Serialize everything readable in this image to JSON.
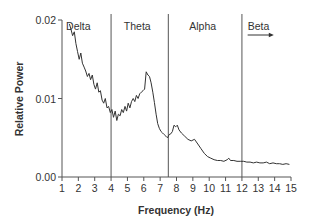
{
  "chart_data": {
    "type": "line",
    "title": "",
    "xlabel": "Frequency (Hz)",
    "ylabel": "Relative Power",
    "xlim": [
      1,
      15
    ],
    "ylim": [
      0,
      0.02
    ],
    "grid": false,
    "legend": "none",
    "x_ticks": [
      1,
      2,
      3,
      4,
      5,
      6,
      7,
      8,
      9,
      10,
      11,
      12,
      13,
      14,
      15
    ],
    "y_ticks": [
      "0.00",
      "0.01",
      "0.02"
    ],
    "y_tick_values": [
      0,
      0.01,
      0.02
    ],
    "bands": [
      {
        "name": "Delta",
        "start": 1,
        "end": 4
      },
      {
        "name": "Theta",
        "start": 4,
        "end": 7.5
      },
      {
        "name": "Alpha",
        "start": 7.5,
        "end": 12
      },
      {
        "name": "Beta",
        "start": 12,
        "end": 15,
        "arrow": true
      }
    ],
    "band_boundaries": [
      4,
      7.5,
      12
    ],
    "series": [
      {
        "name": "Relative Power",
        "x": [
          1.45,
          1.55,
          1.65,
          1.75,
          1.85,
          1.95,
          2.05,
          2.15,
          2.25,
          2.35,
          2.45,
          2.55,
          2.65,
          2.75,
          2.85,
          2.95,
          3.05,
          3.15,
          3.25,
          3.35,
          3.45,
          3.55,
          3.65,
          3.75,
          3.85,
          3.95,
          4.05,
          4.15,
          4.25,
          4.35,
          4.45,
          4.55,
          4.65,
          4.75,
          4.85,
          4.95,
          5.05,
          5.15,
          5.25,
          5.35,
          5.45,
          5.55,
          5.65,
          5.75,
          5.85,
          5.95,
          6.05,
          6.15,
          6.25,
          6.35,
          6.45,
          6.55,
          6.65,
          6.75,
          6.85,
          6.95,
          7.05,
          7.15,
          7.25,
          7.35,
          7.45,
          7.55,
          7.65,
          7.75,
          7.85,
          7.95,
          8.05,
          8.15,
          8.3,
          8.5,
          8.7,
          8.9,
          9.1,
          9.3,
          9.5,
          9.7,
          9.9,
          10.1,
          10.3,
          10.5,
          10.7,
          10.9,
          11.1,
          11.2,
          11.3,
          11.5,
          11.7,
          11.9,
          12.1,
          12.3,
          12.5,
          12.7,
          12.9,
          13.1,
          13.3,
          13.5,
          13.7,
          13.9,
          14.1,
          14.3,
          14.5,
          14.7,
          14.9
        ],
        "y": [
          0.0195,
          0.0188,
          0.018,
          0.0185,
          0.017,
          0.016,
          0.015,
          0.0158,
          0.0145,
          0.014,
          0.0135,
          0.0128,
          0.0132,
          0.0124,
          0.013,
          0.0118,
          0.0112,
          0.012,
          0.0108,
          0.011,
          0.0098,
          0.0094,
          0.01,
          0.0088,
          0.009,
          0.0082,
          0.0086,
          0.0076,
          0.0084,
          0.0072,
          0.008,
          0.0078,
          0.0086,
          0.0082,
          0.009,
          0.0084,
          0.0094,
          0.0088,
          0.0096,
          0.01,
          0.0096,
          0.0104,
          0.01,
          0.0106,
          0.0108,
          0.011,
          0.0112,
          0.0134,
          0.013,
          0.0128,
          0.012,
          0.0108,
          0.0095,
          0.008,
          0.0068,
          0.0062,
          0.0058,
          0.0056,
          0.0054,
          0.0052,
          0.005,
          0.0054,
          0.0055,
          0.0058,
          0.0066,
          0.0064,
          0.0066,
          0.006,
          0.0056,
          0.0052,
          0.0048,
          0.0046,
          0.0048,
          0.0042,
          0.0036,
          0.003,
          0.0026,
          0.0024,
          0.0022,
          0.0021,
          0.0021,
          0.002,
          0.0022,
          0.0024,
          0.0021,
          0.0021,
          0.002,
          0.002,
          0.002,
          0.0019,
          0.0019,
          0.0018,
          0.0019,
          0.0018,
          0.0018,
          0.0019,
          0.0017,
          0.0018,
          0.0017,
          0.0017,
          0.0016,
          0.0017,
          0.0016
        ]
      }
    ]
  },
  "colors": {
    "line": "#333333",
    "axis": "#555555",
    "band_line": "#555555",
    "background": "#ffffff"
  }
}
